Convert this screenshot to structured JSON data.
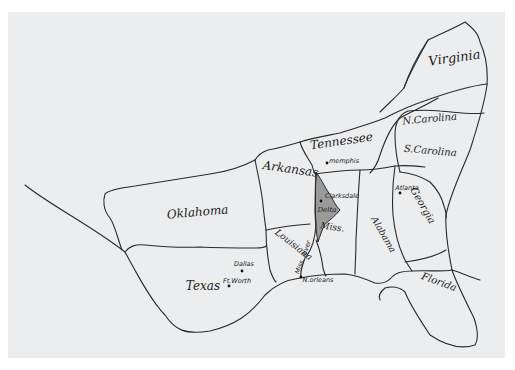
{
  "map": {
    "title": "Hand-drawn map of the American South",
    "states": [
      {
        "id": "virginia",
        "label": "Virginia",
        "x": 455,
        "y": 62,
        "size": 13,
        "rot": -8
      },
      {
        "id": "tennessee",
        "label": "Tennessee",
        "x": 342,
        "y": 145,
        "size": 12,
        "rot": -8
      },
      {
        "id": "n-carolina",
        "label": "N.Carolina",
        "x": 430,
        "y": 122,
        "size": 10,
        "rot": -5
      },
      {
        "id": "s-carolina",
        "label": "S.Carolina",
        "x": 430,
        "y": 154,
        "size": 10,
        "rot": 5
      },
      {
        "id": "arkansas",
        "label": "Arkansas",
        "x": 290,
        "y": 173,
        "size": 12,
        "rot": 8
      },
      {
        "id": "oklahoma",
        "label": "Oklahoma",
        "x": 198,
        "y": 216,
        "size": 12,
        "rot": -5
      },
      {
        "id": "louisiana",
        "label": "Louisiana",
        "x": 292,
        "y": 247,
        "size": 9,
        "rot": 38
      },
      {
        "id": "miss",
        "label": "Miss.",
        "x": 332,
        "y": 230,
        "size": 9,
        "rot": 8
      },
      {
        "id": "alabama",
        "label": "Alabama",
        "x": 381,
        "y": 236,
        "size": 9,
        "rot": 60
      },
      {
        "id": "georgia",
        "label": "Georgia",
        "x": 420,
        "y": 207,
        "size": 10,
        "rot": 60
      },
      {
        "id": "texas",
        "label": "Texas",
        "x": 203,
        "y": 290,
        "size": 12,
        "rot": 0
      },
      {
        "id": "florida",
        "label": "Florida",
        "x": 438,
        "y": 285,
        "size": 10,
        "rot": 20
      }
    ],
    "regions": [
      {
        "id": "delta",
        "label": "Delta",
        "x": 327,
        "y": 212,
        "size": 7,
        "rot": 0,
        "fill": "#8a8a8a"
      }
    ],
    "cities": [
      {
        "id": "memphis",
        "label": "memphis",
        "dot_x": 327,
        "dot_y": 163,
        "x": 344,
        "y": 163
      },
      {
        "id": "clarksdale",
        "label": "Clarksdale",
        "dot_x": 321,
        "dot_y": 201,
        "x": 342,
        "y": 198
      },
      {
        "id": "atlanta",
        "label": "Atlanta",
        "dot_x": 400,
        "dot_y": 193,
        "x": 407,
        "y": 190
      },
      {
        "id": "dallas",
        "label": "Dallas",
        "dot_x": 242,
        "dot_y": 271,
        "x": 244,
        "y": 266
      },
      {
        "id": "ft-worth",
        "label": "Ft.Worth",
        "dot_x": 229,
        "dot_y": 286,
        "x": 237,
        "y": 283
      },
      {
        "id": "new-orleans",
        "label": "N.orleans",
        "dot_x": 301,
        "dot_y": 277,
        "x": 318,
        "y": 282
      }
    ],
    "river": {
      "label": "Miss. River",
      "x": 305,
      "y": 258,
      "size": 5.5,
      "rot": -70
    }
  }
}
